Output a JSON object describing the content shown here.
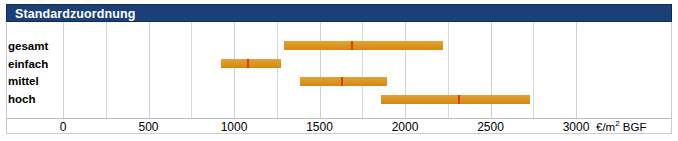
{
  "header": {
    "title": "Standardzuordnung"
  },
  "axis_unit_label": "€/m² BGF",
  "colors": {
    "header_background": "#1b4077",
    "header_text": "#ffffff",
    "bar": "#dd9620",
    "marker": "#d93c12",
    "gridline": "#d5d8dd",
    "frame": "#c9ccd1"
  },
  "chart_data": {
    "type": "bar",
    "subtype": "range-bar-with-median-marker",
    "title": "Standardzuordnung",
    "xlabel": "€/m² BGF",
    "ylabel": "",
    "xlim": [
      0,
      3000
    ],
    "xticks": [
      0,
      500,
      1000,
      1500,
      2000,
      2500,
      3000
    ],
    "xticklabels": [
      "0",
      "500",
      "1000",
      "1500",
      "2000",
      "2500",
      "3000"
    ],
    "grid": true,
    "grid_step": 250,
    "legend": "none",
    "categories": [
      "gesamt",
      "einfach",
      "mittel",
      "hoch"
    ],
    "series": [
      {
        "name": "gesamt",
        "low": 1290,
        "high": 2220,
        "marker": 1685
      },
      {
        "name": "einfach",
        "low": 925,
        "high": 1275,
        "marker": 1075
      },
      {
        "name": "mittel",
        "low": 1385,
        "high": 1895,
        "marker": 1625
      },
      {
        "name": "hoch",
        "low": 1860,
        "high": 2730,
        "marker": 2310
      }
    ]
  }
}
